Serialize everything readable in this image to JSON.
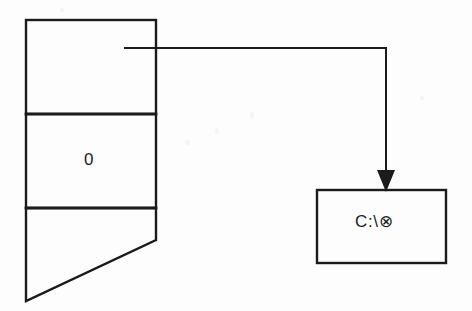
{
  "diagram": {
    "type": "pointer-to-path-diagram",
    "background_color": "#fdfdfd",
    "stroke_color": "#1b1b1b",
    "left_structure": {
      "name": "three-cell-column",
      "x": 26,
      "y": 20,
      "width": 130,
      "cells": [
        {
          "name": "top-cell",
          "label": "",
          "y_top": 20,
          "y_bottom": 114,
          "has_connector_origin": true
        },
        {
          "name": "middle-cell",
          "label": "0",
          "y_top": 114,
          "y_bottom": 208
        },
        {
          "name": "bottom-cell",
          "label": "",
          "y_top": 208,
          "shape": "diagonal-cut",
          "diagonal_from_x": 156,
          "diagonal_from_y": 240,
          "diagonal_to_x": 26,
          "diagonal_to_y": 301
        }
      ]
    },
    "connector": {
      "name": "pointer-arrow",
      "start_x": 124,
      "start_y": 48,
      "corner_x": 386,
      "corner_y": 48,
      "end_x": 386,
      "end_y": 190,
      "arrowhead": "filled-triangle-down"
    },
    "right_box": {
      "name": "path-value-box",
      "label": "C:\\⊗",
      "x": 317,
      "y": 190,
      "width": 129,
      "height": 73
    }
  },
  "labels": {
    "pointer_cell_value": "0",
    "target_path_value": "C:\\⊗"
  }
}
